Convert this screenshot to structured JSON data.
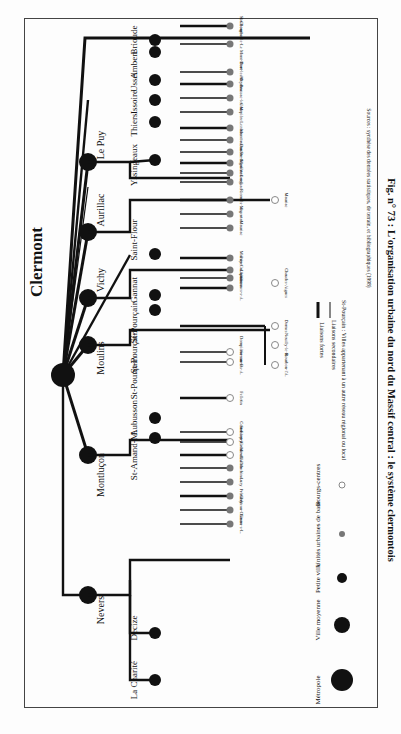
{
  "figure": {
    "caption": "Fig. n° 73 : L'organisation urbaine du nord du Massif central : le système clermontois",
    "sources": "Sources : synthèse des données statistiques, de terrain, et bibliographiques (1998)",
    "orientation": "rotated 90° clockwise"
  },
  "hub": {
    "name": "Clermont",
    "level": "Métropole"
  },
  "villes_moyennes": [
    "Le Puy",
    "Aurillac",
    "Vichy",
    "Moulins",
    "Montluçon",
    "Nevers"
  ],
  "petites_villes": [
    "Brioude",
    "Ambert",
    "Ussel",
    "Issoire",
    "Thiers",
    "Yssingeaux",
    "Saint-Flour",
    "Gannat",
    "St-Pourçain",
    "St-Amand-M.",
    "Aubusson",
    "Decize",
    "La Charité"
  ],
  "unites_urbaines": [
    "St-Georges",
    "La Bourboule-Le Mont-Dore",
    "Bort-les-O.",
    "Meymac",
    "Brassac-les-M.",
    "Courpière",
    "Lezoux",
    "Montfaucon",
    "Dunières",
    "Ste-Sigolène",
    "Monistrol-s-L.",
    "Langeac",
    "Riom-ès-M.",
    "Argentat",
    "Mauriac",
    "Massiac",
    "Puy-Guillaume",
    "Lapalisse",
    "Varennes-s-A.",
    "Dompierre-sur-B.",
    "Varennes-s-A.",
    "Felletin",
    "Commentry",
    "St-Eloy-les-Mines",
    "Cosne-d'Allier",
    "La Machine",
    "Luzy",
    "Prémery",
    "Château-Chinon",
    "Cosne-s-L."
  ],
  "bourgs_centres": [
    "Mauriac",
    "Chaudes-Aigues",
    "Dornes",
    "Neuilly-le-R.",
    "Bourbon-l'A.",
    "Auzances",
    "Chambon",
    "Evaux",
    "Boussac",
    "Montmarault"
  ],
  "legend": {
    "nodes": [
      {
        "label": "Métropole",
        "size": 34
      },
      {
        "label": "Ville moyenne",
        "size": 26
      },
      {
        "label": "Petite ville",
        "size": 16
      },
      {
        "label": "Unités urbaines de base",
        "size": 7
      },
      {
        "label": "Bourgs-centres",
        "size": 7,
        "hollow": true
      }
    ],
    "lines": [
      {
        "label": "Liaisons fortes",
        "weight": "strong"
      },
      {
        "label": "Liaisons secondaires",
        "weight": "weak"
      }
    ],
    "note_label": "St-Pourçain",
    "note_text": "Villes appartenant à un autre réseau régional ou local"
  },
  "colors": {
    "ink": "#111111",
    "paper": "#fdfdfd",
    "unit": "#777777",
    "frame": "#444444"
  }
}
